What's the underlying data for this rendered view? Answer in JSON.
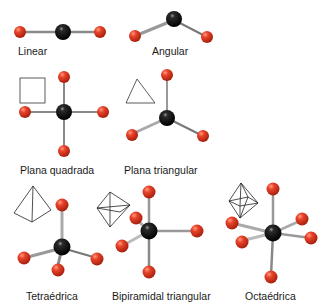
{
  "colors": {
    "central_atom": "#0a0a0a",
    "ligand_atom": "#d9341c",
    "bond": "#8a8a8a",
    "outline": "#222222"
  },
  "geometries": [
    {
      "name": "Linear",
      "label": "Linear"
    },
    {
      "name": "Angular",
      "label": "Angular"
    },
    {
      "name": "Plana quadrada",
      "label": "Plana quadrada"
    },
    {
      "name": "Plana triangular",
      "label": "Plana triangular"
    },
    {
      "name": "Tetraedrica",
      "label": "Tetraédrica"
    },
    {
      "name": "Bipiramidal triangular",
      "label": "Bipiramidal triangular"
    },
    {
      "name": "Octaedrica",
      "label": "Octaédrica"
    }
  ]
}
